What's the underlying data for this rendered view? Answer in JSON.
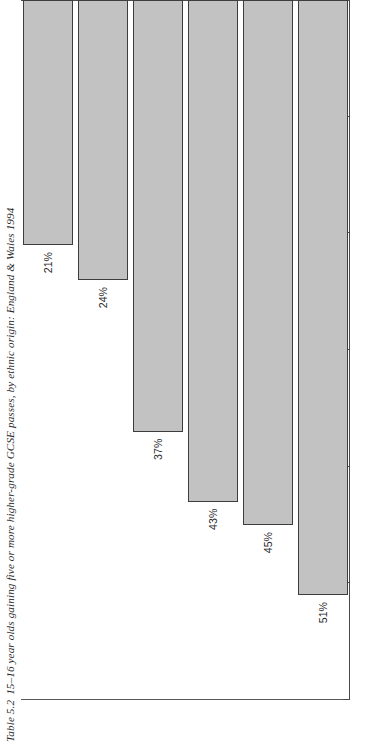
{
  "caption": {
    "number": "Table 5.2",
    "text": "15–16 year olds gaining five or more higher-grade GCSE passes, by ethnic origin: England & Wales 1994",
    "full": "Table 5.2  15–16 year olds gaining five or more higher-grade GCSE passes, by ethnic origin: England & Wales 1994"
  },
  "colors": {
    "bar_fill": "#c2c2c2",
    "bar_border": "#3d3d3d",
    "axis": "#4a4a4a",
    "text": "#1f1f1f",
    "background": "#ffffff"
  },
  "chart_data": {
    "type": "bar",
    "orientation": "horizontal",
    "title": "Table 5.2  15–16 year olds gaining five or more higher-grade GCSE passes, by ethnic origin: England & Wales 1994",
    "xlabel": "",
    "ylabel": "",
    "categories": [
      "Chinese & Other Asian",
      "Indian",
      "White",
      "Other",
      "Pakistani/Bangladeshi",
      "Black"
    ],
    "values": [
      51,
      45,
      43,
      37,
      24,
      21
    ],
    "value_labels": [
      "51%",
      "45%",
      "43%",
      "37%",
      "24%",
      "21%"
    ],
    "ylim": [
      0,
      60
    ],
    "ticks": [
      0,
      10,
      20,
      30,
      40,
      50,
      60
    ],
    "tick_labels": [
      "0%",
      "10%",
      "20%",
      "30%",
      "40%",
      "50%",
      "60%"
    ],
    "grid": false,
    "legend": false,
    "units": "percent"
  }
}
